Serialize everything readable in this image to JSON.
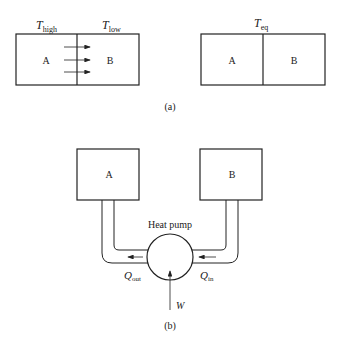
{
  "panel_a": {
    "left": {
      "t_high": "T",
      "t_high_sub": "high",
      "t_low": "T",
      "t_low_sub": "low",
      "box_a": "A",
      "box_b": "B"
    },
    "right": {
      "t_eq": "T",
      "t_eq_sub": "eq",
      "box_a": "A",
      "box_b": "B"
    },
    "caption": "(a)"
  },
  "panel_b": {
    "box_a": "A",
    "box_b": "B",
    "pump_label": "Heat pump",
    "q_out": "Q",
    "q_out_sub": "out",
    "q_in": "Q",
    "q_in_sub": "in",
    "work": "W",
    "caption": "(b)"
  }
}
